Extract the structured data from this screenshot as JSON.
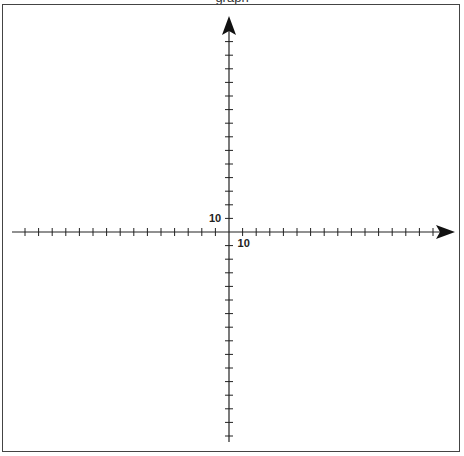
{
  "title": {
    "text": "graph"
  },
  "grid": {
    "origin_px": [
      229,
      232
    ],
    "tick_spacing_px": 13.6,
    "x_ticks_negative": 15,
    "x_ticks_positive": 15,
    "y_ticks_positive": 14,
    "y_ticks_negative": 15,
    "tick_half_length_px": 4
  },
  "axes": {
    "x_axis": {
      "start_px": 12,
      "arrow_tip_px": 455,
      "label": "10",
      "label_tick_index": 1
    },
    "y_axis": {
      "arrow_tip_px": 16,
      "end_px": 442,
      "label": "10",
      "label_tick_index": 1
    },
    "tick_unit_value": 10,
    "color": "#222222",
    "arrow_color": "#111111"
  },
  "frame": {
    "border_color": "#444444",
    "background": "#ffffff"
  }
}
